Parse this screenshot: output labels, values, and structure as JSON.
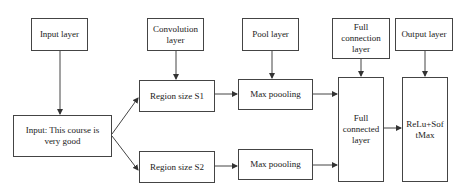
{
  "diagram": {
    "labels": {
      "input_layer": "Input layer",
      "convolution_layer": "Convolution layer",
      "pool_layer": "Pool layer",
      "full_connection_layer": "Full connection layer",
      "output_layer": "Output layer"
    },
    "nodes": {
      "input": "Input: This course is very good",
      "region_s1": "Region size S1",
      "region_s2": "Region size S2",
      "max_pool_1": "Max poooling",
      "max_pool_2": "Max poooling",
      "full_connected": "Full connected layer",
      "output": "ReLu+SoftMax"
    },
    "edges": [
      [
        "input_layer",
        "input"
      ],
      [
        "input",
        "region_s1"
      ],
      [
        "input",
        "region_s2"
      ],
      [
        "convolution_layer",
        "region_s1"
      ],
      [
        "region_s1",
        "max_pool_1"
      ],
      [
        "region_s2",
        "max_pool_2"
      ],
      [
        "pool_layer",
        "max_pool_1"
      ],
      [
        "max_pool_1",
        "full_connected"
      ],
      [
        "max_pool_2",
        "full_connected"
      ],
      [
        "full_connection_layer",
        "full_connected"
      ],
      [
        "full_connected",
        "output"
      ],
      [
        "output_layer",
        "output"
      ]
    ],
    "colors": {
      "line": "#444444",
      "background": "#ffffff"
    }
  }
}
